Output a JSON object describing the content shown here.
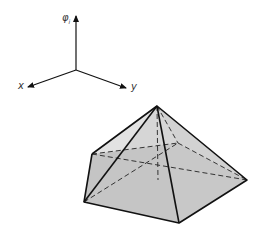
{
  "axes": {
    "vertical_label": "φ",
    "vertical_subscript": "i",
    "x_label": "x",
    "y_label": "y"
  },
  "figure": {
    "fill_colors": {
      "base": "#bdbdbd",
      "side_light": "#dcdcdc",
      "side_mid": "#c8c8c8"
    },
    "stroke_color": "#111111"
  }
}
